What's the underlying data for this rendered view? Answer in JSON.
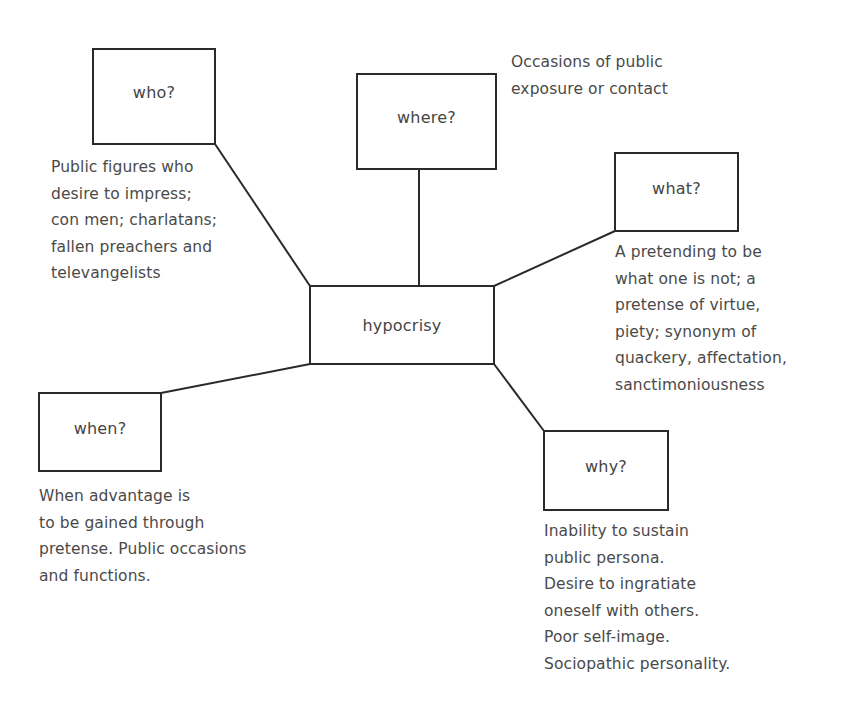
{
  "diagram": {
    "type": "spider-map",
    "center": {
      "label": "hypocrisy"
    },
    "nodes": {
      "who": {
        "label": "who?",
        "note": "Public figures who\ndesire to impress;\ncon men; charlatans;\nfallen preachers and\ntelevangelists"
      },
      "where": {
        "label": "where?",
        "note": "Occasions of public\nexposure or contact"
      },
      "what": {
        "label": "what?",
        "note": "A pretending to be\nwhat one is not; a\npretense of virtue,\npiety; synonym of\nquackery, affectation,\nsanctimoniousness"
      },
      "when": {
        "label": "when?",
        "note": "When advantage is\nto be gained through\npretense. Public occasions\nand functions."
      },
      "why": {
        "label": "why?",
        "note": "Inability to sustain\npublic persona.\nDesire to ingratiate\noneself with others.\nPoor self-image.\nSociopathic personality."
      }
    },
    "colors": {
      "line": "#2a2a2a",
      "text": "#4a4a4a",
      "background": "#ffffff"
    }
  }
}
